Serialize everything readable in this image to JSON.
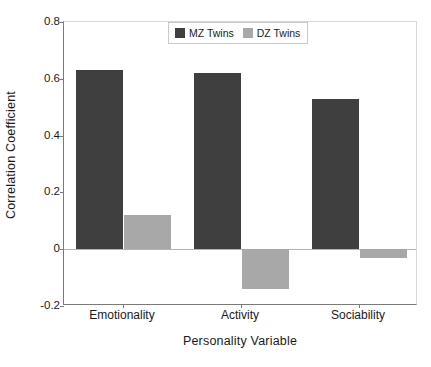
{
  "chart_data": {
    "type": "bar",
    "title": "",
    "xlabel": "Personality Variable",
    "ylabel": "Correlation Coefficient",
    "categories": [
      "Emotionality",
      "Activity",
      "Sociability"
    ],
    "series": [
      {
        "name": "MZ Twins",
        "color": "#3f3f3f",
        "values": [
          0.63,
          0.62,
          0.53
        ]
      },
      {
        "name": "DZ Twins",
        "color": "#a8a8a8",
        "values": [
          0.12,
          -0.14,
          -0.03
        ]
      }
    ],
    "ylim": [
      -0.2,
      0.8
    ],
    "yticks": [
      0.8,
      0.6,
      0.4,
      0.2,
      0,
      -0.2
    ],
    "ytick_labels": [
      "0.8",
      "0.6",
      "0.4",
      "0.2",
      "0",
      "-0.2"
    ],
    "grid": false,
    "zero_line": true,
    "legend_position": "top-center",
    "legend_entries": [
      "MZ Twins",
      "DZ Twins"
    ],
    "bar_mode": "grouped",
    "background_color": "#ffffff",
    "axis_color": "#7a7a7a"
  }
}
